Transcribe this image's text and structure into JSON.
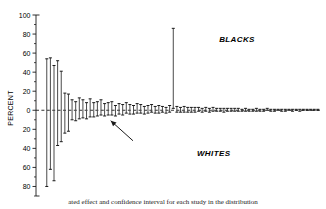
{
  "figure": {
    "ylabel": "PERCENT",
    "group_high_label": "BLACKS",
    "group_low_label": "WHITES",
    "caption": "ated effect and confidence interval for each study in the distribution"
  },
  "chart_data": {
    "type": "scatter",
    "title": "",
    "xlabel": "",
    "ylabel": "PERCENT",
    "ylim": [
      -90,
      100
    ],
    "xlim": [
      0,
      100
    ],
    "grid": false,
    "legend": null,
    "zero_line": 0,
    "ytick_labels": [
      "100",
      "80",
      "60",
      "40",
      "20",
      "0",
      "20",
      "40",
      "60",
      "80"
    ],
    "ytick_values": [
      100,
      80,
      60,
      40,
      20,
      0,
      -20,
      -40,
      -60,
      -80
    ],
    "minor_ticks": true,
    "annotations": [
      {
        "text": "BLACKS",
        "x": 63,
        "y": 72,
        "style": "italic"
      },
      {
        "text": "WHITES",
        "x": 55,
        "y": -48,
        "style": "italic"
      },
      {
        "text": "",
        "type": "arrow",
        "x_tail": 32,
        "y_tail": -32,
        "x_head": 24,
        "y_head": -11
      }
    ],
    "series": [
      {
        "name": "Confidence intervals",
        "marker": "error-bar",
        "points": [
          {
            "x": 1.0,
            "estimate": -6,
            "low": -80,
            "high": 54
          },
          {
            "x": 2.3,
            "estimate": 41,
            "low": -62,
            "high": 55
          },
          {
            "x": 3.6,
            "estimate": 2,
            "low": -74,
            "high": 47
          },
          {
            "x": 4.9,
            "estimate": 44,
            "low": -37,
            "high": 52
          },
          {
            "x": 6.2,
            "estimate": 40,
            "low": -33,
            "high": 41
          },
          {
            "x": 7.5,
            "estimate": 3,
            "low": -24,
            "high": 18
          },
          {
            "x": 8.8,
            "estimate": 1,
            "low": -22,
            "high": 17
          },
          {
            "x": 10.1,
            "estimate": 0,
            "low": -10,
            "high": 11
          },
          {
            "x": 11.4,
            "estimate": -1,
            "low": -11,
            "high": 9
          },
          {
            "x": 12.7,
            "estimate": 2,
            "low": -9,
            "high": 13
          },
          {
            "x": 14.0,
            "estimate": 1,
            "low": -8,
            "high": 11
          },
          {
            "x": 15.3,
            "estimate": -1,
            "low": -9,
            "high": 8
          },
          {
            "x": 16.6,
            "estimate": 2,
            "low": -7,
            "high": 12
          },
          {
            "x": 17.9,
            "estimate": 0,
            "low": -7,
            "high": 8
          },
          {
            "x": 19.2,
            "estimate": 1,
            "low": -6,
            "high": 9
          },
          {
            "x": 20.5,
            "estimate": 3,
            "low": -5,
            "high": 11
          },
          {
            "x": 21.8,
            "estimate": 0,
            "low": -6,
            "high": 7
          },
          {
            "x": 23.1,
            "estimate": 1,
            "low": -5,
            "high": 8
          },
          {
            "x": 24.4,
            "estimate": 2,
            "low": -5,
            "high": 9
          },
          {
            "x": 25.7,
            "estimate": -1,
            "low": -6,
            "high": 5
          },
          {
            "x": 27.0,
            "estimate": 1,
            "low": -4,
            "high": 7
          },
          {
            "x": 28.3,
            "estimate": 0,
            "low": -5,
            "high": 6
          },
          {
            "x": 29.6,
            "estimate": 2,
            "low": -3,
            "high": 8
          },
          {
            "x": 30.9,
            "estimate": 1,
            "low": -4,
            "high": 6
          },
          {
            "x": 32.2,
            "estimate": 0,
            "low": -4,
            "high": 5
          },
          {
            "x": 33.5,
            "estimate": 2,
            "low": -3,
            "high": 7
          },
          {
            "x": 34.8,
            "estimate": 1,
            "low": -3,
            "high": 6
          },
          {
            "x": 36.1,
            "estimate": 0,
            "low": -4,
            "high": 4
          },
          {
            "x": 37.4,
            "estimate": 1,
            "low": -3,
            "high": 5
          },
          {
            "x": 38.7,
            "estimate": 2,
            "low": -2,
            "high": 6
          },
          {
            "x": 40.0,
            "estimate": 0,
            "low": -3,
            "high": 4
          },
          {
            "x": 41.3,
            "estimate": 1,
            "low": -3,
            "high": 5
          },
          {
            "x": 42.6,
            "estimate": 1,
            "low": -2,
            "high": 4
          },
          {
            "x": 43.9,
            "estimate": 0,
            "low": -3,
            "high": 3
          },
          {
            "x": 45.2,
            "estimate": 2,
            "low": -2,
            "high": 5
          },
          {
            "x": 46.5,
            "estimate": 85,
            "low": 2,
            "high": 86
          },
          {
            "x": 47.8,
            "estimate": 1,
            "low": -2,
            "high": 4
          },
          {
            "x": 49.1,
            "estimate": 0,
            "low": -2,
            "high": 3
          },
          {
            "x": 50.4,
            "estimate": 1,
            "low": -2,
            "high": 4
          },
          {
            "x": 51.7,
            "estimate": 0,
            "low": -2,
            "high": 3
          },
          {
            "x": 53.0,
            "estimate": 1,
            "low": -2,
            "high": 3
          },
          {
            "x": 54.3,
            "estimate": 0,
            "low": -2,
            "high": 3
          },
          {
            "x": 55.6,
            "estimate": 1,
            "low": -1,
            "high": 3
          },
          {
            "x": 56.9,
            "estimate": 0,
            "low": -2,
            "high": 2
          },
          {
            "x": 58.2,
            "estimate": 1,
            "low": -1,
            "high": 3
          },
          {
            "x": 59.5,
            "estimate": 0,
            "low": -2,
            "high": 2
          },
          {
            "x": 60.8,
            "estimate": 1,
            "low": -1,
            "high": 3
          },
          {
            "x": 62.1,
            "estimate": 0,
            "low": -1,
            "high": 2
          },
          {
            "x": 63.4,
            "estimate": 1,
            "low": -1,
            "high": 2
          },
          {
            "x": 64.7,
            "estimate": 0,
            "low": -2,
            "high": 2
          },
          {
            "x": 66.0,
            "estimate": 1,
            "low": -1,
            "high": 2
          },
          {
            "x": 67.3,
            "estimate": 0,
            "low": -1,
            "high": 2
          },
          {
            "x": 68.6,
            "estimate": 0,
            "low": -1,
            "high": 2
          },
          {
            "x": 69.9,
            "estimate": 1,
            "low": -1,
            "high": 2
          },
          {
            "x": 71.2,
            "estimate": 0,
            "low": -1,
            "high": 1
          },
          {
            "x": 72.5,
            "estimate": 1,
            "low": -1,
            "high": 2
          },
          {
            "x": 73.8,
            "estimate": 0,
            "low": -1,
            "high": 1
          },
          {
            "x": 75.1,
            "estimate": 0,
            "low": -1,
            "high": 1
          },
          {
            "x": 76.4,
            "estimate": 1,
            "low": -1,
            "high": 2
          },
          {
            "x": 77.7,
            "estimate": 0,
            "low": -1,
            "high": 1
          },
          {
            "x": 79.0,
            "estimate": 0,
            "low": -1,
            "high": 1
          },
          {
            "x": 80.3,
            "estimate": 1,
            "low": 0,
            "high": 2
          },
          {
            "x": 81.6,
            "estimate": 0,
            "low": -1,
            "high": 1
          },
          {
            "x": 82.9,
            "estimate": 0,
            "low": -1,
            "high": 1
          },
          {
            "x": 84.2,
            "estimate": 1,
            "low": 0,
            "high": 1
          },
          {
            "x": 85.5,
            "estimate": 0,
            "low": -1,
            "high": 1
          },
          {
            "x": 86.8,
            "estimate": 0,
            "low": -1,
            "high": 1
          },
          {
            "x": 88.1,
            "estimate": 1,
            "low": 0,
            "high": 1
          },
          {
            "x": 89.4,
            "estimate": 0,
            "low": -1,
            "high": 1
          },
          {
            "x": 90.7,
            "estimate": 0,
            "low": 0,
            "high": 1
          },
          {
            "x": 92.0,
            "estimate": 0,
            "low": -1,
            "high": 1
          },
          {
            "x": 93.3,
            "estimate": 1,
            "low": 0,
            "high": 1
          },
          {
            "x": 94.6,
            "estimate": 0,
            "low": 0,
            "high": 1
          },
          {
            "x": 95.9,
            "estimate": 0,
            "low": 0,
            "high": 1
          },
          {
            "x": 97.2,
            "estimate": 0,
            "low": 0,
            "high": 1
          },
          {
            "x": 98.5,
            "estimate": 0,
            "low": 0,
            "high": 1
          }
        ]
      }
    ]
  }
}
